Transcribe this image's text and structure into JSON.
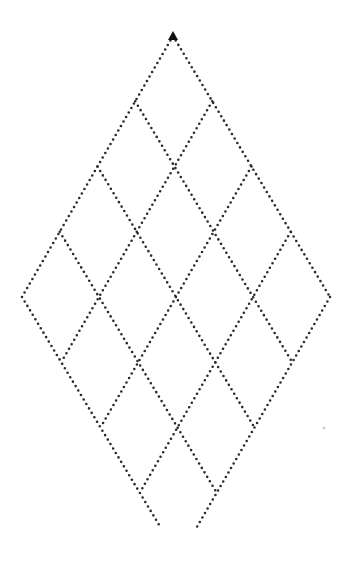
{
  "diagram": {
    "type": "rhombus-lattice",
    "cells_per_side": 4,
    "top_vertex": [
      173,
      36
    ],
    "step_down_left": [
      -37.75,
      65.25
    ],
    "step_down_right": [
      39.25,
      65.25
    ],
    "cutoff_y": 528,
    "line_color": "#2a2a2a",
    "marker": {
      "shape": "filled-triangle",
      "position": "top-vertex",
      "color": "#111111"
    }
  }
}
